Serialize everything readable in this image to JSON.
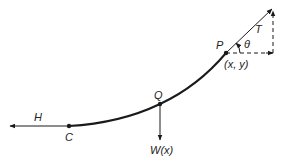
{
  "diagram": {
    "type": "free-body diagram of hanging cable segment",
    "colors": {
      "stroke": "#1a1a1a",
      "background": "#ffffff"
    },
    "points": {
      "C": {
        "label": "C"
      },
      "Q": {
        "label": "Q"
      },
      "P": {
        "label": "P",
        "coord_label": "(x, y)"
      }
    },
    "forces": {
      "H": {
        "label": "H"
      },
      "W": {
        "label": "W(x)"
      },
      "T": {
        "label": "T"
      }
    },
    "angle": {
      "label": "θ"
    }
  }
}
